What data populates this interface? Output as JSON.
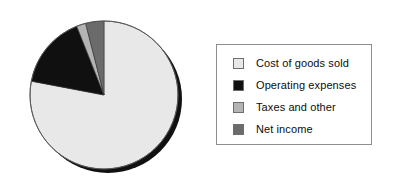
{
  "chart_data": {
    "type": "pie",
    "title": "",
    "subtitle": "",
    "xlabel": "",
    "ylabel": "",
    "grid": false,
    "legend_position": "right",
    "start_angle_deg": 0,
    "direction": "clockwise",
    "categories": [
      "Cost of goods sold",
      "Operating expenses",
      "Taxes and other",
      "Net income"
    ],
    "values": [
      78,
      16,
      2,
      4
    ],
    "colors": [
      "#e8e8e8",
      "#101010",
      "#b4b4b4",
      "#6b6b6b"
    ],
    "slices": [
      {
        "label": "Cost of goods sold",
        "value": 78,
        "color": "#e8e8e8"
      },
      {
        "label": "Operating expenses",
        "value": 16,
        "color": "#101010"
      },
      {
        "label": "Taxes and other",
        "value": 2,
        "color": "#b4b4b4"
      },
      {
        "label": "Net income",
        "value": 4,
        "color": "#6b6b6b"
      }
    ]
  },
  "pie": {
    "center_x": 104,
    "center_y": 95,
    "radius": 74,
    "shadow_color": "#111111",
    "outline_color": "#555555"
  },
  "legend": {
    "border_color": "#8e8e8e",
    "background": "#ffffff",
    "items": [
      {
        "label": "Cost of goods sold",
        "color": "#e8e8e8"
      },
      {
        "label": "Operating expenses",
        "color": "#101010"
      },
      {
        "label": "Taxes and other",
        "color": "#b4b4b4"
      },
      {
        "label": "Net income",
        "color": "#6b6b6b"
      }
    ]
  }
}
